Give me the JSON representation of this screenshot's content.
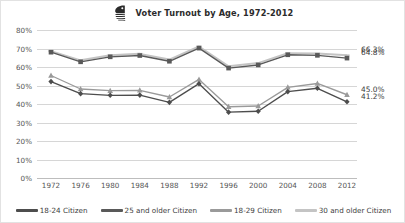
{
  "header": {
    "title": "Voter Turnout by Age, 1972-2012",
    "logo_icon": "census-bureau-logo-icon"
  },
  "chart_data": {
    "type": "line",
    "title": "Voter Turnout by Age, 1972-2012",
    "xlabel": "",
    "ylabel": "",
    "ylim": [
      0,
      80
    ],
    "ytick_labels": [
      "80%",
      "70%",
      "60%",
      "50%",
      "40%",
      "30%",
      "20%",
      "10%",
      "0%"
    ],
    "ytick_values": [
      80,
      70,
      60,
      50,
      40,
      30,
      20,
      10,
      0
    ],
    "grid": true,
    "legend_position": "bottom",
    "categories": [
      1972,
      1976,
      1980,
      1984,
      1988,
      1992,
      1996,
      2000,
      2004,
      2008,
      2012
    ],
    "xtick_labels": [
      "1972",
      "1976",
      "1980",
      "1984",
      "1988",
      "1992",
      "1996",
      "2000",
      "2004",
      "2008",
      "2012"
    ],
    "series": [
      {
        "name": "18-24 Citizen",
        "color": "#4d4d4d",
        "marker": "diamond",
        "values": [
          52.1,
          45.6,
          44.7,
          44.8,
          40.9,
          51.0,
          35.6,
          36.1,
          46.7,
          48.5,
          41.2
        ],
        "end_label": "41.2%"
      },
      {
        "name": "25 and older Citizen",
        "color": "#595959",
        "marker": "square",
        "values": [
          68.0,
          62.8,
          65.5,
          66.2,
          63.1,
          70.2,
          59.4,
          61.1,
          66.6,
          66.3,
          64.8
        ],
        "end_label": "64.8%"
      },
      {
        "name": "18-29 Citizen",
        "color": "#9a9a9a",
        "marker": "triangle",
        "values": [
          55.4,
          48.1,
          47.2,
          47.4,
          43.8,
          53.3,
          38.5,
          38.9,
          49.0,
          51.1,
          45.0
        ],
        "end_label": "45.0%"
      },
      {
        "name": "30 and older Citizen",
        "color": "#c4c4c4",
        "marker": "line",
        "values": [
          68.6,
          63.6,
          66.3,
          67.1,
          64.0,
          71.1,
          60.4,
          62.1,
          67.5,
          67.3,
          66.3
        ],
        "end_label": "66.3%"
      }
    ],
    "end_labels": [
      {
        "text": "66.3%",
        "value": 66.3
      },
      {
        "text": "64.8%",
        "value": 64.8
      },
      {
        "text": "45.0%",
        "value": 45.0
      },
      {
        "text": "41.2%",
        "value": 41.2
      }
    ]
  }
}
